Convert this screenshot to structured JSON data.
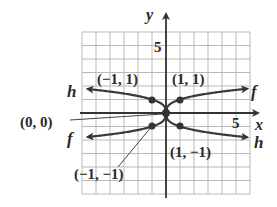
{
  "axes": {
    "x_label": "x",
    "y_label": "y",
    "x_tick_label": "5",
    "y_tick_label": "5",
    "x_range": [
      -6,
      6
    ],
    "y_range": [
      -6,
      6
    ]
  },
  "functions": [
    {
      "name": "f",
      "rule": "cube root of x",
      "left_label": "f",
      "right_label": "f"
    },
    {
      "name": "h",
      "rule": "negative cube root of x",
      "left_label": "h",
      "right_label": "h"
    }
  ],
  "points": [
    {
      "label": "(−1, 1)",
      "x": -1,
      "y": 1
    },
    {
      "label": "(1, 1)",
      "x": 1,
      "y": 1
    },
    {
      "label": "(0, 0)",
      "x": 0,
      "y": 0
    },
    {
      "label": "(−1, −1)",
      "x": -1,
      "y": -1
    },
    {
      "label": "(1, −1)",
      "x": 1,
      "y": -1
    }
  ],
  "chart_data": {
    "type": "line",
    "title": "",
    "xlabel": "x",
    "ylabel": "y",
    "xlim": [
      -6,
      6
    ],
    "ylim": [
      -6,
      6
    ],
    "grid": true,
    "series": [
      {
        "name": "f",
        "x": [
          -6,
          -1,
          0,
          1,
          6
        ],
        "y": [
          -1.82,
          -1,
          0,
          1,
          1.82
        ]
      },
      {
        "name": "h",
        "x": [
          -6,
          -1,
          0,
          1,
          6
        ],
        "y": [
          1.82,
          1,
          0,
          -1,
          -1.82
        ]
      }
    ],
    "annotations": [
      "(−1, 1)",
      "(1, 1)",
      "(0, 0)",
      "(−1, −1)",
      "(1, −1)"
    ],
    "tick_labels": {
      "x": [
        "5"
      ],
      "y": [
        "5"
      ]
    }
  }
}
